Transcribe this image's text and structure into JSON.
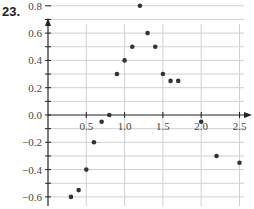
{
  "problem_number": "23.",
  "chart_data": {
    "type": "scatter",
    "title": "",
    "xlabel": "",
    "ylabel": "",
    "xlim": [
      0,
      2.6
    ],
    "ylim": [
      -0.85,
      0.9
    ],
    "grid": true,
    "x_ticks": [
      "0.5",
      "1.0",
      "1.5",
      "2.0",
      "2.5"
    ],
    "y_ticks": [
      "0.8",
      "0.6",
      "0.4",
      "0.2",
      "0.0",
      "−0.2",
      "−0.4",
      "−0.6",
      "−0.8"
    ],
    "points": [
      {
        "x": 0.2,
        "y": -0.8
      },
      {
        "x": 0.3,
        "y": -0.6
      },
      {
        "x": 0.4,
        "y": -0.55
      },
      {
        "x": 0.5,
        "y": -0.4
      },
      {
        "x": 0.6,
        "y": -0.2
      },
      {
        "x": 0.7,
        "y": -0.05
      },
      {
        "x": 0.8,
        "y": 0.0
      },
      {
        "x": 0.9,
        "y": 0.3
      },
      {
        "x": 1.0,
        "y": 0.4
      },
      {
        "x": 1.1,
        "y": 0.5
      },
      {
        "x": 1.2,
        "y": 0.8
      },
      {
        "x": 1.3,
        "y": 0.6
      },
      {
        "x": 1.4,
        "y": 0.5
      },
      {
        "x": 1.5,
        "y": 0.3
      },
      {
        "x": 1.6,
        "y": 0.25
      },
      {
        "x": 1.7,
        "y": 0.25
      },
      {
        "x": 2.0,
        "y": -0.05
      },
      {
        "x": 2.2,
        "y": -0.3
      },
      {
        "x": 2.5,
        "y": -0.35
      }
    ]
  },
  "colors": {
    "axis": "#222222",
    "grid": "#cfcfcf",
    "point": "#333333",
    "label": "#444444"
  }
}
